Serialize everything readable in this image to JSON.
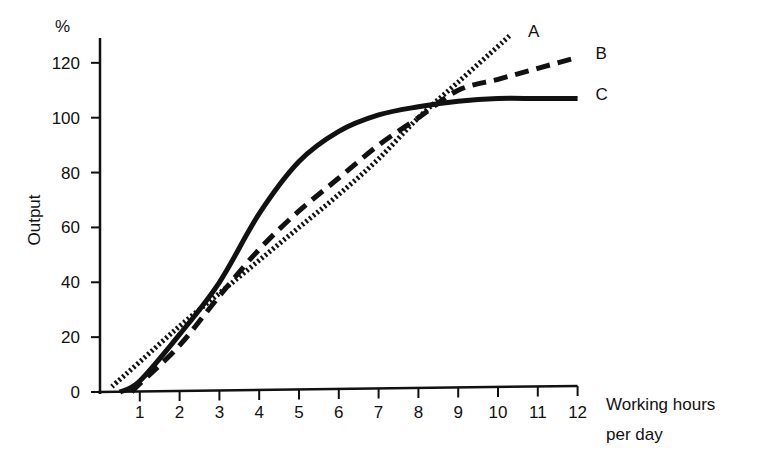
{
  "chart_data": {
    "type": "line",
    "title": "",
    "xlabel": "Working hours per day",
    "xlabel_lines": [
      "Working hours",
      "per day"
    ],
    "ylabel": "Output",
    "yunit": "%",
    "xlim": [
      0,
      12
    ],
    "ylim": [
      0,
      130
    ],
    "x_ticks": [
      1,
      2,
      3,
      4,
      5,
      6,
      7,
      8,
      9,
      10,
      11,
      12
    ],
    "y_ticks": [
      0,
      20,
      40,
      60,
      80,
      100,
      120
    ],
    "grid": false,
    "legend": "inline labels at line ends",
    "series": [
      {
        "name": "A",
        "style": "dotted",
        "x": [
          0.3,
          1,
          2,
          3,
          4,
          5,
          6,
          7,
          8,
          9,
          10,
          10.3
        ],
        "values": [
          2,
          11,
          24,
          36,
          48,
          60,
          72,
          85,
          100,
          113,
          126,
          130
        ]
      },
      {
        "name": "B",
        "style": "dashed",
        "x": [
          0.8,
          1,
          2,
          3,
          4,
          5,
          6,
          7,
          8,
          9,
          10,
          11,
          12
        ],
        "values": [
          0,
          3,
          17,
          35,
          52,
          66,
          78,
          90,
          100,
          110,
          114,
          118,
          122
        ]
      },
      {
        "name": "C",
        "style": "solid",
        "x": [
          0.5,
          1,
          2,
          3,
          4,
          5,
          6,
          7,
          8,
          9,
          10,
          11,
          12
        ],
        "values": [
          0,
          4,
          21,
          40,
          65,
          84,
          95,
          101,
          104,
          106,
          107,
          107,
          107
        ]
      }
    ],
    "annotations": [
      "A",
      "B",
      "C"
    ]
  }
}
